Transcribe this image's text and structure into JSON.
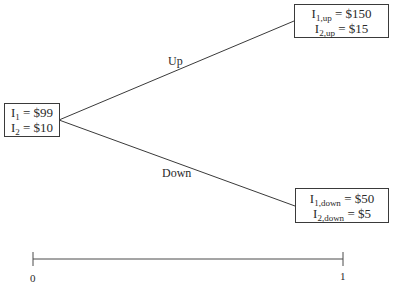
{
  "diagram": {
    "type": "binomial-tree",
    "root": {
      "rows": [
        {
          "var": "I",
          "sub": "1",
          "value": "= $99"
        },
        {
          "var": "I",
          "sub": "2",
          "value": "= $10"
        }
      ]
    },
    "branches": [
      {
        "label": "Up",
        "node": {
          "rows": [
            {
              "var": "I",
              "sub": "1,up",
              "value": "= $150"
            },
            {
              "var": "I",
              "sub": "2,up",
              "value": "= $15"
            }
          ]
        }
      },
      {
        "label": "Down",
        "node": {
          "rows": [
            {
              "var": "I",
              "sub": "1,down",
              "value": "= $50"
            },
            {
              "var": "I",
              "sub": "2,down",
              "value": "= $5"
            }
          ]
        }
      }
    ],
    "timeline": {
      "start_label": "0",
      "end_label": "1"
    }
  }
}
